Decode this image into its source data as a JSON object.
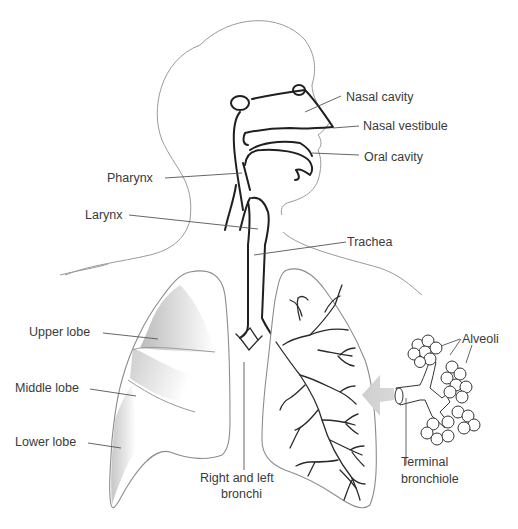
{
  "labels": {
    "nasal_cavity": "Nasal cavity",
    "nasal_vestibule": "Nasal vestibule",
    "oral_cavity": "Oral cavity",
    "pharynx": "Pharynx",
    "larynx": "Larynx",
    "trachea": "Trachea",
    "upper_lobe": "Upper lobe",
    "middle_lobe": "Middle lobe",
    "lower_lobe": "Lower lobe",
    "bronchi_line1": "Right and left",
    "bronchi_line2": "bronchi",
    "alveoli": "Alveoli",
    "terminal_line1": "Terminal",
    "terminal_line2": "bronchiole"
  },
  "colors": {
    "background": "#ffffff",
    "outline": "#9a9a9a",
    "airway": "#1f1f1f",
    "shading": "#c8c8c8",
    "arrow": "#d4d4d4",
    "text": "#3a3a3a"
  }
}
